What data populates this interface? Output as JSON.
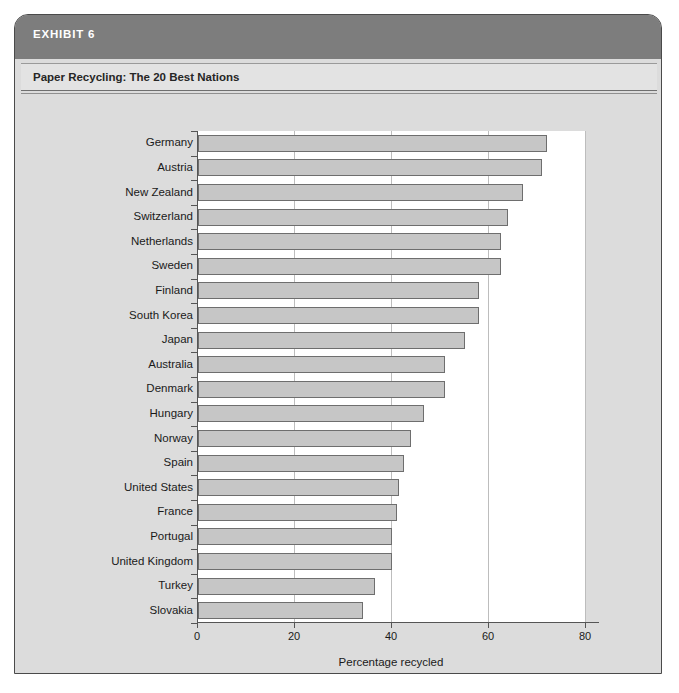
{
  "exhibit": {
    "label": "EXHIBIT 6",
    "subtitle": "Paper Recycling: The 20 Best Nations"
  },
  "colors": {
    "band": "#7d7d7d",
    "subtitle_bar": "#e3e3e3",
    "panel": "#dcdcdc",
    "plot_background": "#ffffff",
    "bar_fill": "#c6c6c6",
    "bar_border": "#6e6e6e",
    "gridline": "#bdbdbd",
    "axis": "#555555",
    "text": "#1a1a1a",
    "band_text": "#ffffff"
  },
  "chart_data": {
    "type": "bar",
    "orientation": "horizontal",
    "title": "Paper Recycling: The 20 Best Nations",
    "subtitle": "",
    "xlabel": "Percentage recycled",
    "ylabel": "",
    "xlim": [
      0,
      80
    ],
    "xticks": [
      0,
      20,
      40,
      60,
      80
    ],
    "xticklabels": [
      "0",
      "20",
      "40",
      "60",
      "80"
    ],
    "grid": "vertical",
    "legend": "none",
    "categories": [
      "Germany",
      "Austria",
      "New Zealand",
      "Switzerland",
      "Netherlands",
      "Sweden",
      "Finland",
      "South Korea",
      "Japan",
      "Australia",
      "Denmark",
      "Hungary",
      "Norway",
      "Spain",
      "United States",
      "France",
      "Portugal",
      "United Kingdom",
      "Turkey",
      "Slovakia"
    ],
    "values": [
      72,
      71,
      67,
      64,
      62.5,
      62.5,
      58,
      58,
      55,
      51,
      51,
      46.5,
      44,
      42.5,
      41.5,
      41,
      40,
      40,
      36.5,
      34
    ]
  }
}
